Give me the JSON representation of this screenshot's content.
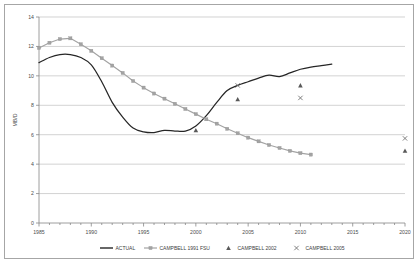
{
  "chart_data": {
    "type": "line",
    "title": "",
    "xlabel": "",
    "ylabel": "MB/D",
    "xlim": [
      1985,
      2020
    ],
    "ylim": [
      0,
      14
    ],
    "ytick_step": 2,
    "grid": true,
    "legend_position": "bottom",
    "x_ticks": [
      "1985",
      "1990",
      "1995",
      "2000",
      "2005",
      "2010",
      "2015",
      "2020"
    ],
    "y_ticks": [
      "0",
      "2",
      "4",
      "6",
      "8",
      "10",
      "12",
      "14"
    ],
    "series": [
      {
        "name": "ACTUAL",
        "style": "line",
        "color": "#262626",
        "x": [
          1985,
          1986,
          1987,
          1988,
          1989,
          1990,
          1991,
          1992,
          1993,
          1994,
          1995,
          1996,
          1997,
          1998,
          1999,
          2000,
          2001,
          2002,
          2003,
          2004,
          2005,
          2006,
          2007,
          2008,
          2009,
          2010,
          2011,
          2012,
          2013
        ],
        "values": [
          10.9,
          11.25,
          11.45,
          11.45,
          11.25,
          10.75,
          9.6,
          8.2,
          7.2,
          6.45,
          6.2,
          6.15,
          6.3,
          6.25,
          6.25,
          6.6,
          7.3,
          8.2,
          9.0,
          9.35,
          9.6,
          9.85,
          10.05,
          9.95,
          10.2,
          10.45,
          10.6,
          10.7,
          10.8
        ]
      },
      {
        "name": "CAMPBELL 1991 FSU",
        "style": "line-markers",
        "marker": "square",
        "color": "#a3a3a3",
        "x": [
          1985,
          1986,
          1987,
          1988,
          1989,
          1990,
          1991,
          1992,
          1993,
          1994,
          1995,
          1996,
          1997,
          1998,
          1999,
          2000,
          2001,
          2002,
          2003,
          2004,
          2005,
          2006,
          2007,
          2008,
          2009,
          2010,
          2011
        ],
        "values": [
          11.9,
          12.25,
          12.5,
          12.55,
          12.15,
          11.7,
          11.2,
          10.7,
          10.2,
          9.65,
          9.2,
          8.8,
          8.45,
          8.1,
          7.75,
          7.4,
          7.05,
          6.75,
          6.4,
          6.1,
          5.8,
          5.55,
          5.3,
          5.1,
          4.9,
          4.75,
          4.65
        ]
      },
      {
        "name": "CAMPBELL 2002",
        "style": "scatter",
        "marker": "triangle",
        "color": "#595959",
        "x": [
          2000,
          2004,
          2010,
          2020
        ],
        "values": [
          6.3,
          8.4,
          9.35,
          4.9
        ]
      },
      {
        "name": "CAMPBELL 2005",
        "style": "scatter",
        "marker": "cross",
        "color": "#6b6b6b",
        "x": [
          2004,
          2010,
          2020
        ],
        "values": [
          9.35,
          8.5,
          5.75
        ]
      }
    ]
  },
  "legend": {
    "items": [
      {
        "label": "ACTUAL",
        "marker": "line"
      },
      {
        "label": "CAMPBELL 1991 FSU",
        "marker": "line-square"
      },
      {
        "label": "CAMPBELL 2002",
        "marker": "triangle"
      },
      {
        "label": "CAMPBELL 2005",
        "marker": "cross"
      }
    ]
  },
  "axes": {
    "y_title": "MB/D"
  }
}
